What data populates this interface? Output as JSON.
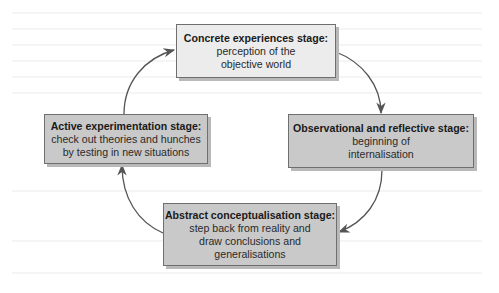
{
  "diagram": {
    "type": "cycle",
    "stages": [
      {
        "id": "concrete",
        "title": "Concrete experiences stage:",
        "description": "perception of the\nobjective world"
      },
      {
        "id": "observational",
        "title": "Observational and reflective stage:",
        "description": "beginning of\ninternalisation"
      },
      {
        "id": "abstract",
        "title": "Abstract conceptualisation stage:",
        "description": "step back from reality and\ndraw conclusions and\ngeneralisations"
      },
      {
        "id": "active",
        "title": "Active experimentation stage:",
        "description": "check out theories and hunches\nby testing in new situations"
      }
    ],
    "flow": [
      [
        "concrete",
        "observational"
      ],
      [
        "observational",
        "abstract"
      ],
      [
        "abstract",
        "active"
      ],
      [
        "active",
        "concrete"
      ]
    ],
    "colors": {
      "light_box_fill": "#ececec",
      "dark_box_fill": "#c9c9c9",
      "border": "#6f6f6f",
      "shadow": "#b9b9b9",
      "arrow": "#555555",
      "background": "#ffffff"
    }
  }
}
